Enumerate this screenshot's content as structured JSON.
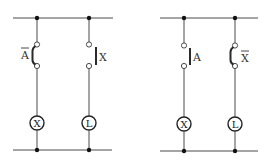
{
  "diagram": {
    "type": "relay ladder circuit",
    "circuits": [
      {
        "id": "left",
        "branches": [
          {
            "switch": {
              "label": "A",
              "negated": true,
              "state": "closed",
              "label_side": "left"
            },
            "load": {
              "label": "X"
            }
          },
          {
            "switch": {
              "label": "X",
              "negated": false,
              "state": "open",
              "label_side": "right"
            },
            "load": {
              "label": "L"
            }
          }
        ]
      },
      {
        "id": "right",
        "branches": [
          {
            "switch": {
              "label": "A",
              "negated": false,
              "state": "open",
              "label_side": "right"
            },
            "load": {
              "label": "X"
            }
          },
          {
            "switch": {
              "label": "X",
              "negated": true,
              "state": "closed",
              "label_side": "right"
            },
            "load": {
              "label": "L"
            }
          }
        ]
      }
    ]
  },
  "labels": {
    "left_sw1": "A",
    "left_sw2": "X",
    "left_load1": "X",
    "left_load2": "L",
    "right_sw1": "A",
    "right_sw2": "X",
    "right_load1": "X",
    "right_load2": "L"
  }
}
